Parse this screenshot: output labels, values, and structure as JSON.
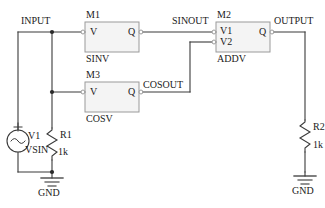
{
  "diagram": {
    "type": "circuit-schematic",
    "background_color": "#ffffff",
    "wire_color": "#3a3a3a",
    "block_fill": "#f4f4f4",
    "block_stroke": "#9a9a9a",
    "text_color": "#1a1a1a"
  },
  "nets": [
    {
      "name": "INPUT",
      "label": "INPUT"
    },
    {
      "name": "SINOUT",
      "label": "SINOUT"
    },
    {
      "name": "COSOUT",
      "label": "COSOUT"
    },
    {
      "name": "OUTPUT",
      "label": "OUTPUT"
    }
  ],
  "blocks": [
    {
      "ref": "M1",
      "ref_label": "M1",
      "model": "SINV",
      "inputs": [
        "V"
      ],
      "outputs": [
        "Q"
      ]
    },
    {
      "ref": "M3",
      "ref_label": "M3",
      "model": "COSV",
      "inputs": [
        "V"
      ],
      "outputs": [
        "Q"
      ]
    },
    {
      "ref": "M2",
      "ref_label": "M2",
      "model": "ADDV",
      "inputs": [
        "V1",
        "V2"
      ],
      "outputs": [
        "Q"
      ]
    }
  ],
  "components": [
    {
      "ref": "V1",
      "ref_label": "V1",
      "model": "VSIN",
      "kind": "sine-voltage-source",
      "polarity": "+"
    },
    {
      "ref": "R1",
      "ref_label": "R1",
      "value": "1k",
      "kind": "resistor"
    },
    {
      "ref": "R2",
      "ref_label": "R2",
      "value": "1k",
      "kind": "resistor"
    }
  ],
  "grounds": [
    {
      "label": "GND",
      "id": "gnd-left"
    },
    {
      "label": "GND",
      "id": "gnd-right"
    }
  ]
}
